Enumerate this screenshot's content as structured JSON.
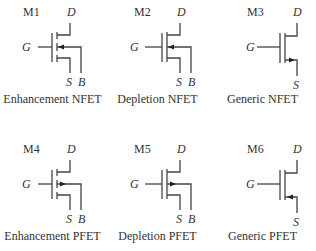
{
  "transistors": [
    {
      "id": "M1",
      "caption": "Enhancement NFET",
      "gate": "G",
      "drain": "D",
      "source": "S",
      "body": "B",
      "type": "enhancement",
      "polarity": "N"
    },
    {
      "id": "M2",
      "caption": "Depletion NFET",
      "gate": "G",
      "drain": "D",
      "source": "S",
      "body": "B",
      "type": "depletion",
      "polarity": "N"
    },
    {
      "id": "M3",
      "caption": "Generic NFET",
      "gate": "G",
      "drain": "D",
      "source": "S",
      "type": "generic",
      "polarity": "N"
    },
    {
      "id": "M4",
      "caption": "Enhancement PFET",
      "gate": "G",
      "drain": "D",
      "source": "S",
      "body": "B",
      "type": "enhancement",
      "polarity": "P"
    },
    {
      "id": "M5",
      "caption": "Depletion PFET",
      "gate": "G",
      "drain": "D",
      "source": "S",
      "body": "B",
      "type": "depletion",
      "polarity": "P"
    },
    {
      "id": "M6",
      "caption": "Generic PFET",
      "gate": "G",
      "drain": "D",
      "source": "S",
      "type": "generic",
      "polarity": "P"
    }
  ]
}
